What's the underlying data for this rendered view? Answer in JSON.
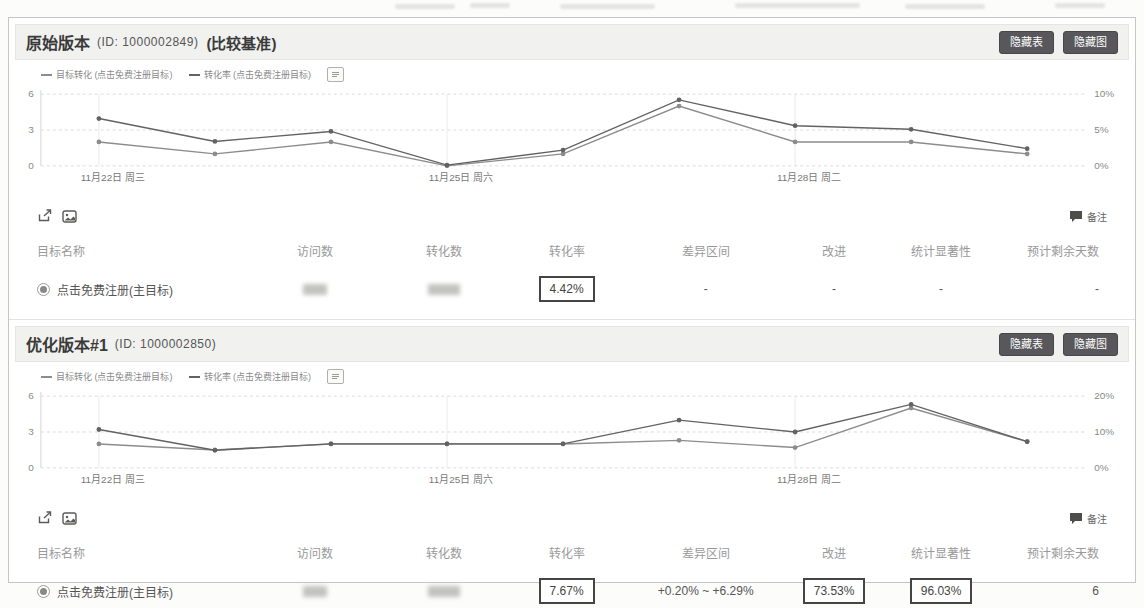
{
  "colors": {
    "panel_header_bg": "#f1f1ef",
    "button_bg": "#58575b",
    "boxed_border": "#454545",
    "grid_line": "#dddddd",
    "axis_text": "#888888"
  },
  "icon_names": [
    "share-icon",
    "save-image-icon",
    "comment-icon",
    "legend-settings-icon",
    "radio-icon"
  ],
  "panels": [
    {
      "title": "原始版本",
      "id_label": "(ID: 1000002849)",
      "baseline_label": "(比较基准)",
      "buttons": [
        {
          "label": "隐藏表"
        },
        {
          "label": "隐藏图"
        }
      ],
      "note_label": "备注",
      "table": {
        "headers": [
          "目标名称",
          "访问数",
          "转化数",
          "转化率",
          "差异区间",
          "改进",
          "统计显著性",
          "预计剩余天数"
        ],
        "row": {
          "goal": "点击免费注册(主目标)",
          "visits_hidden": true,
          "conversions_hidden": true,
          "rate": "4.42%",
          "interval": "-",
          "improvement": "-",
          "significance": "-",
          "days": "-"
        }
      }
    },
    {
      "title": "优化版本#1",
      "id_label": "(ID: 1000002850)",
      "baseline_label": "",
      "buttons": [
        {
          "label": "隐藏表"
        },
        {
          "label": "隐藏图"
        }
      ],
      "note_label": "备注",
      "table": {
        "headers": [
          "目标名称",
          "访问数",
          "转化数",
          "转化率",
          "差异区间",
          "改进",
          "统计显著性",
          "预计剩余天数"
        ],
        "row": {
          "goal": "点击免费注册(主目标)",
          "visits_hidden": true,
          "conversions_hidden": true,
          "rate": "7.67%",
          "interval": "+0.20% ~ +6.29%",
          "improvement": "73.53%",
          "significance": "96.03%",
          "days": "6"
        }
      }
    }
  ],
  "chart_data": [
    {
      "type": "line",
      "title": "原始版本 每日趋势",
      "x": [
        "11-22",
        "11-23",
        "11-24",
        "11-25",
        "11-26",
        "11-27",
        "11-28",
        "11-29",
        "11-30"
      ],
      "x_labels": [
        "11月22日 周三",
        "11月25日 周六",
        "11月28日 周二"
      ],
      "x_label_slots": [
        0,
        3,
        6
      ],
      "left_axis": {
        "max": 6,
        "ticks": [
          0,
          3,
          6
        ]
      },
      "right_axis": {
        "max": 10,
        "ticks": [
          "0%",
          "5%",
          "10%"
        ]
      },
      "grid": true,
      "legend_position": "top-left",
      "series": [
        {
          "name": "目标转化 (点击免费注册目标)",
          "axis": "left",
          "color": "#8c8c8c",
          "values": [
            2,
            1,
            2,
            0,
            1,
            5,
            2,
            2,
            1
          ]
        },
        {
          "name": "转化率 (点击免费注册目标)",
          "axis": "right",
          "color": "#626262",
          "values": [
            6.6,
            3.4,
            4.8,
            0.1,
            2.2,
            9.2,
            5.6,
            5.1,
            2.4
          ]
        }
      ]
    },
    {
      "type": "line",
      "title": "优化版本#1 每日趋势",
      "x": [
        "11-22",
        "11-23",
        "11-24",
        "11-25",
        "11-26",
        "11-27",
        "11-28",
        "11-29",
        "11-30"
      ],
      "x_labels": [
        "11月22日 周三",
        "11月25日 周六",
        "11月28日 周二"
      ],
      "x_label_slots": [
        0,
        3,
        6
      ],
      "left_axis": {
        "max": 6,
        "ticks": [
          0,
          3,
          6
        ]
      },
      "right_axis": {
        "max": 20,
        "ticks": [
          "0%",
          "10%",
          "20%"
        ]
      },
      "grid": true,
      "legend_position": "top-left",
      "series": [
        {
          "name": "目标转化 (点击免费注册目标)",
          "axis": "left",
          "color": "#8c8c8c",
          "values": [
            2,
            1.5,
            2,
            2,
            2,
            2.3,
            1.7,
            5,
            2.2
          ]
        },
        {
          "name": "转化率 (点击免费注册目标)",
          "axis": "right",
          "color": "#626262",
          "values": [
            10.7,
            4.9,
            6.7,
            6.7,
            6.7,
            13.3,
            10,
            17.7,
            7.3
          ]
        }
      ]
    }
  ]
}
